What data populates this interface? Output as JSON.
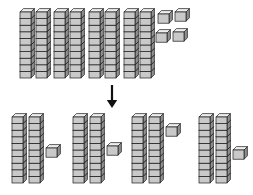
{
  "illustration": {
    "title": "Base-ten blocks division model",
    "description": "Eighty-four unit cubes shown as 8 rods of ten plus 4 ones, separated by a downward arrow into 4 equal groups of 2 rods plus 1 one.",
    "block_unit_value": 1,
    "rod_unit_count": 10,
    "colors": {
      "outline": "#1a1a1a",
      "face_front": "#c9c9c9",
      "face_top": "#efefef",
      "face_side": "#8f8f8f",
      "arrow": "#111111",
      "background": "#ffffff"
    }
  },
  "top_set": {
    "label": "dividend",
    "total_value": 84,
    "rod_count": 8,
    "rod_value": 10,
    "loose_cube_count": 4,
    "loose_cube_value": 1,
    "rods": [
      {
        "index": 1,
        "x": 20,
        "value": 10
      },
      {
        "index": 2,
        "x": 36,
        "value": 10
      },
      {
        "index": 3,
        "x": 54,
        "value": 10
      },
      {
        "index": 4,
        "x": 70,
        "value": 10
      },
      {
        "index": 5,
        "x": 89,
        "value": 10
      },
      {
        "index": 6,
        "x": 105,
        "value": 10
      },
      {
        "index": 7,
        "x": 124,
        "value": 10
      },
      {
        "index": 8,
        "x": 140,
        "value": 10
      }
    ],
    "loose_cubes": [
      {
        "index": 1,
        "x": 158,
        "y": 14
      },
      {
        "index": 2,
        "x": 175,
        "y": 12
      },
      {
        "index": 3,
        "x": 156,
        "y": 33
      },
      {
        "index": 4,
        "x": 173,
        "y": 32
      }
    ]
  },
  "arrow": {
    "name": "down-arrow",
    "x": 112,
    "y_start": 85,
    "y_end": 108,
    "direction": "down"
  },
  "bottom_groups": {
    "label": "quotient groups",
    "group_count": 4,
    "value_per_group": 21,
    "groups": [
      {
        "index": 1,
        "rod_count": 2,
        "cube_count": 1,
        "value": 21,
        "rods": [
          {
            "x": 12
          },
          {
            "x": 29
          }
        ],
        "cubes": [
          {
            "x": 46,
            "y": 148
          }
        ]
      },
      {
        "index": 2,
        "rod_count": 2,
        "cube_count": 1,
        "value": 21,
        "rods": [
          {
            "x": 73
          },
          {
            "x": 90
          }
        ],
        "cubes": [
          {
            "x": 107,
            "y": 146
          }
        ]
      },
      {
        "index": 3,
        "rod_count": 2,
        "cube_count": 1,
        "value": 21,
        "rods": [
          {
            "x": 132
          },
          {
            "x": 149
          }
        ],
        "cubes": [
          {
            "x": 166,
            "y": 127
          }
        ]
      },
      {
        "index": 4,
        "rod_count": 2,
        "cube_count": 1,
        "value": 21,
        "rods": [
          {
            "x": 199
          },
          {
            "x": 216
          }
        ],
        "cubes": [
          {
            "x": 233,
            "y": 150
          }
        ]
      }
    ]
  },
  "geometry": {
    "cube_width": 11,
    "cube_height": 6.6,
    "depth_x": 3.4,
    "depth_y": 3.4,
    "top_rod_y": 12,
    "bottom_rod_y": 117
  }
}
